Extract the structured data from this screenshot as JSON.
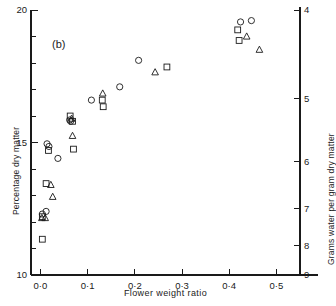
{
  "figure": {
    "panel_label": "(b)",
    "background": "#ffffff",
    "ink": "#1a1a1a"
  },
  "chart_data": {
    "type": "scatter",
    "title": "",
    "panel": "(b)",
    "xlabel": "Flower weight ratio",
    "ylabel": "Percentage dry matter",
    "y2label": "Grams water per gram dry matter",
    "xlim": [
      -0.02,
      0.55
    ],
    "ylim": [
      10,
      20
    ],
    "grid": false,
    "legend": "none",
    "xticks": [
      0.0,
      0.1,
      0.2,
      0.3,
      0.4,
      0.5
    ],
    "xticklabels": [
      "0·0",
      "0·1",
      "0·2",
      "0·3",
      "0·4",
      "0·5"
    ],
    "yticks": [
      10,
      11,
      12,
      13,
      14,
      15,
      16,
      17,
      18,
      19,
      20
    ],
    "yticklabels": [
      "10",
      "",
      "",
      "",
      "",
      "15",
      "",
      "",
      "",
      "",
      "20"
    ],
    "y2ticks": [
      4,
      5,
      6,
      7,
      8,
      9
    ],
    "y2ticklabels": [
      "4",
      "5",
      "6",
      "7",
      "8",
      "9"
    ],
    "y2_note": "right axis is reciprocal of left: grams water per gram dry matter = (100 - %DM)/%DM",
    "series": [
      {
        "name": "circles",
        "marker": "circle",
        "fill": "none",
        "points": [
          [
            0.004,
            12.3
          ],
          [
            0.012,
            12.4
          ],
          [
            0.014,
            14.95
          ],
          [
            0.018,
            14.85
          ],
          [
            0.037,
            14.4
          ],
          [
            0.062,
            15.85
          ],
          [
            0.064,
            15.8
          ],
          [
            0.108,
            16.6
          ],
          [
            0.168,
            17.1
          ],
          [
            0.208,
            18.1
          ],
          [
            0.424,
            19.55
          ],
          [
            0.447,
            19.6
          ]
        ]
      },
      {
        "name": "squares",
        "marker": "square",
        "fill": "none",
        "points": [
          [
            0.004,
            12.2
          ],
          [
            0.004,
            11.35
          ],
          [
            0.012,
            13.45
          ],
          [
            0.017,
            14.7
          ],
          [
            0.063,
            16.0
          ],
          [
            0.068,
            15.8
          ],
          [
            0.07,
            14.75
          ],
          [
            0.131,
            16.6
          ],
          [
            0.133,
            16.35
          ],
          [
            0.268,
            17.85
          ],
          [
            0.418,
            19.25
          ],
          [
            0.421,
            18.85
          ]
        ]
      },
      {
        "name": "triangles",
        "marker": "triangle",
        "fill": "none",
        "points": [
          [
            0.003,
            12.15
          ],
          [
            0.01,
            12.15
          ],
          [
            0.022,
            13.4
          ],
          [
            0.026,
            12.95
          ],
          [
            0.066,
            15.9
          ],
          [
            0.068,
            15.25
          ],
          [
            0.132,
            16.85
          ],
          [
            0.243,
            17.65
          ],
          [
            0.437,
            19.0
          ],
          [
            0.464,
            18.5
          ]
        ]
      }
    ]
  }
}
